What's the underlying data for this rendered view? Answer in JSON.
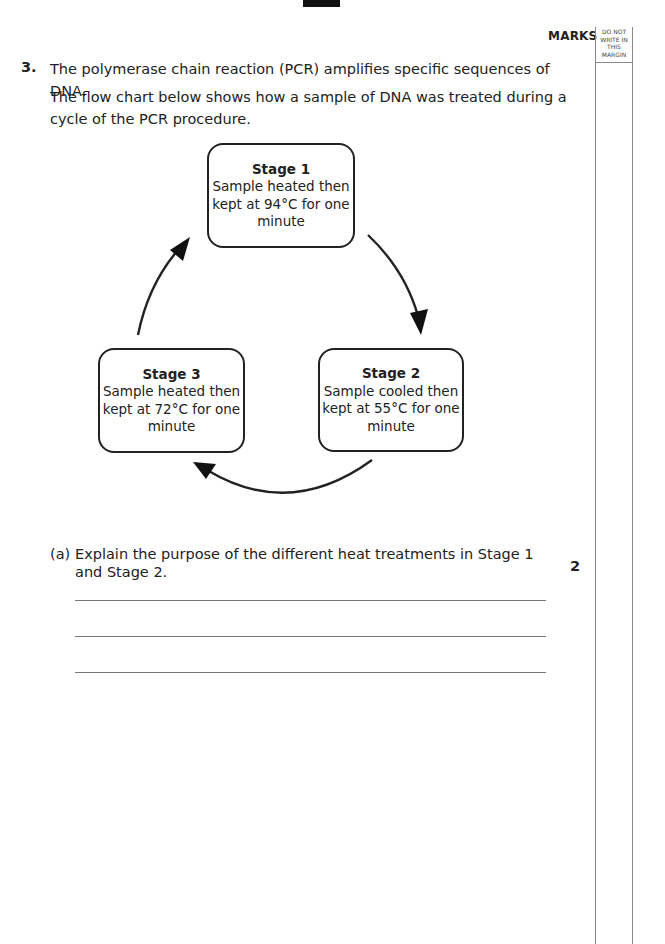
{
  "header": {
    "marks_label": "MARKS",
    "margin_note": [
      "DO NOT",
      "WRITE IN",
      "THIS",
      "MARGIN"
    ]
  },
  "question": {
    "number": "3.",
    "intro": "The polymerase chain reaction (PCR) amplifies specific sequences of DNA.",
    "lead": "The flow chart below shows how a sample of DNA was treated during a cycle of the PCR procedure."
  },
  "flowchart": {
    "stages": [
      {
        "title": "Stage 1",
        "lines": [
          "Sample heated then",
          "kept at 94°C for one",
          "minute"
        ]
      },
      {
        "title": "Stage 2",
        "lines": [
          "Sample cooled then",
          "kept at 55°C for one",
          "minute"
        ]
      },
      {
        "title": "Stage 3",
        "lines": [
          "Sample heated then",
          "kept at 72°C for one",
          "minute"
        ]
      }
    ],
    "arrows": [
      "stage1-to-stage2",
      "stage2-to-stage3",
      "stage3-to-stage1"
    ]
  },
  "part_a": {
    "label": "(a)",
    "text": "Explain the purpose of the different heat treatments in Stage 1 and Stage 2.",
    "marks": "2",
    "answer_lines": 3
  }
}
